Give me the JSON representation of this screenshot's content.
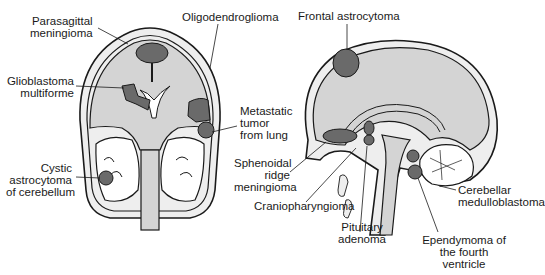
{
  "figure": {
    "colors": {
      "brain_fill": "#d4d4d4",
      "tumor": "#6a6a6a",
      "outline": "#1a1a1a",
      "skull": "#eeeeee",
      "background": "#ffffff"
    },
    "coronal_view": {
      "labels": {
        "parasagittal_1": "Parasagittal",
        "parasagittal_2": "meningioma",
        "oligo": "Oligodendroglioma",
        "glio_1": "Glioblastoma",
        "glio_2": "multiforme",
        "meta_1": "Metastatic",
        "meta_2": "tumor",
        "meta_3": "from lung",
        "cystic_1": "Cystic",
        "cystic_2": "astrocytoma",
        "cystic_3": "of cerebellum"
      }
    },
    "sagittal_view": {
      "labels": {
        "frontal": "Frontal astrocytoma",
        "spheno_1": "Sphenoidal",
        "spheno_2": "ridge",
        "spheno_3": "meningioma",
        "cranio": "Craniopharyngioma",
        "pit_1": "Pituitary",
        "pit_2": "adenoma",
        "cereb_1": "Cerebellar",
        "cereb_2": "medulloblastoma",
        "epen_1": "Ependymoma of",
        "epen_2": "the fourth",
        "epen_3": "ventricle"
      }
    }
  }
}
